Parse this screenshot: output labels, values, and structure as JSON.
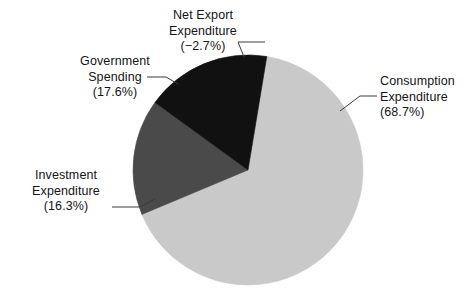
{
  "chart_data": {
    "type": "pie",
    "title": "",
    "subtitle": "",
    "xlabel": "",
    "ylabel": "",
    "legend_position": "none",
    "grid": false,
    "units": "percent",
    "categories": [
      "Consumption Expenditure",
      "Investment Expenditure",
      "Government Spending",
      "Net Export Expenditure"
    ],
    "values": [
      68.7,
      16.3,
      17.6,
      -2.7
    ],
    "value_labels": [
      "(68.7%)",
      "(16.3%)",
      "(17.6%)",
      "(−2.7%)"
    ],
    "colors": [
      "#c9c9c9",
      "#4a4a4a",
      "#111111",
      "#c9c9c9"
    ],
    "slices": [
      {
        "name": "Consumption Expenditure",
        "label_line1": "Consumption",
        "label_line2": "Expenditure",
        "label_line3": "(68.7%)",
        "value": 68.7,
        "color": "#c9c9c9",
        "start_angle_deg": 0,
        "sweep_deg": 247.3
      },
      {
        "name": "Investment Expenditure",
        "label_line1": "Investment",
        "label_line2": "Expenditure",
        "label_line3": "(16.3%)",
        "value": 16.3,
        "color": "#4a4a4a",
        "start_angle_deg": 247.3,
        "sweep_deg": 58.7
      },
      {
        "name": "Government Spending",
        "label_line1": "Government",
        "label_line2": "Spending",
        "label_line3": "(17.6%)",
        "value": 17.6,
        "color": "#111111",
        "start_angle_deg": 306.0,
        "sweep_deg": 63.4
      },
      {
        "name": "Net Export Expenditure",
        "label_line1": "Net Export",
        "label_line2": "Expenditure",
        "label_line3": "(−2.7%)",
        "value": -2.7,
        "color": "#c9c9c9",
        "start_angle_deg": 369.4,
        "sweep_deg": 0
      }
    ]
  },
  "geometry": {
    "center_x": 248,
    "center_y": 170,
    "radius": 115
  },
  "style": {
    "background": "#ffffff",
    "leader_line_color": "#3a3a3a",
    "text_color": "#141414",
    "light_gray": "#c9c9c9",
    "dark_gray": "#4a4a4a",
    "black": "#111111"
  }
}
